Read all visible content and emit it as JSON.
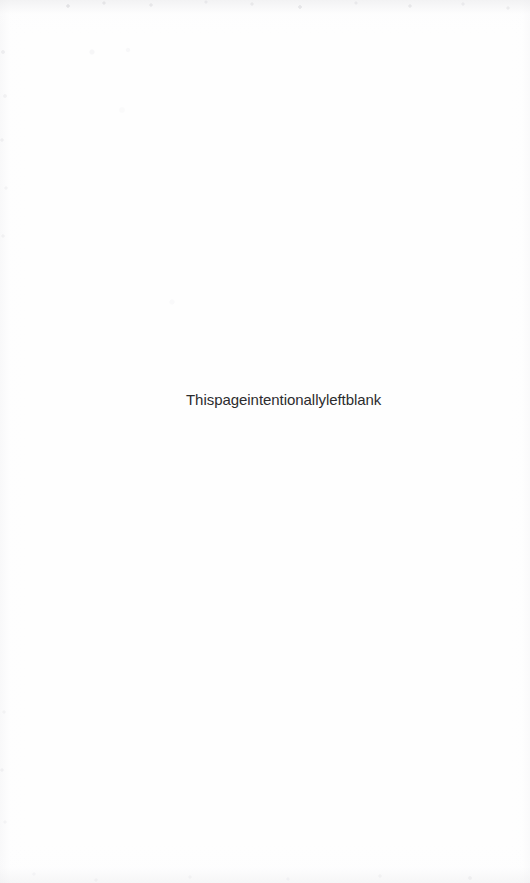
{
  "page": {
    "kind": "scanned-book-page",
    "background_color": "#fefefe",
    "width": 530,
    "height": 883
  },
  "content": {
    "notice_text": "Thispageintentionallyleftblank",
    "notice_color": "#2c2c2e"
  },
  "artifacts": {
    "scan_noise_color": "#d5d5d9",
    "edge_tone_color": "#ececee"
  }
}
